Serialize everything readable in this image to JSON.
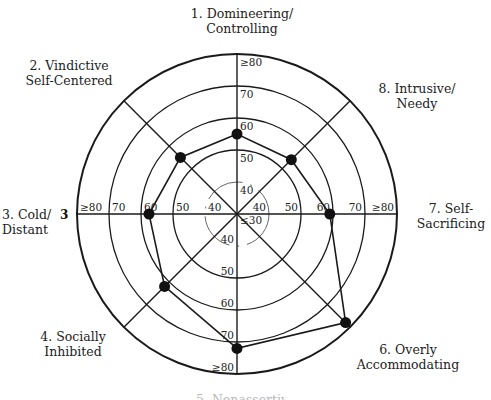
{
  "chart_data": {
    "type": "radar",
    "title": "",
    "center_value_label": "≤30",
    "axis_range": [
      30,
      80
    ],
    "ring_values": [
      40,
      50,
      60,
      70,
      80
    ],
    "ring_labels": [
      "40",
      "50",
      "60",
      "70",
      "≥80"
    ],
    "octants": [
      {
        "number": 1,
        "label": "1. Domineering/\nControlling",
        "value": 55
      },
      {
        "number": 2,
        "label": "2. Vindictive\nSelf-Centered",
        "value": 55
      },
      {
        "number": 3,
        "label": "3. Cold/\nDistant",
        "value": 57.5
      },
      {
        "number": 4,
        "label": "4. Socially\nInhibited",
        "value": 62
      },
      {
        "number": 5,
        "label": "5. Nonassertive",
        "value": 72
      },
      {
        "number": 6,
        "label": "6. Overly\nAccommodating",
        "value": 78
      },
      {
        "number": 7,
        "label": "7. Self-\nSacrificing",
        "value": 59
      },
      {
        "number": 8,
        "label": "8. Intrusive/\nNeedy",
        "value": 54
      }
    ],
    "side_marker": "3",
    "grid": true,
    "legend": "none"
  }
}
